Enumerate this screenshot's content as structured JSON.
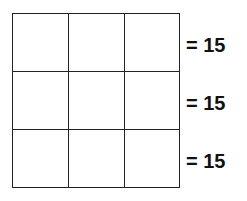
{
  "grid": {
    "rows": 3,
    "cols": 3,
    "cells": [
      [
        "",
        "",
        ""
      ],
      [
        "",
        "",
        ""
      ],
      [
        "",
        "",
        ""
      ]
    ]
  },
  "row_sums": [
    {
      "equals": "=",
      "value": "15",
      "label": "= 15"
    },
    {
      "equals": "=",
      "value": "15",
      "label": "= 15"
    },
    {
      "equals": "=",
      "value": "15",
      "label": "= 15"
    }
  ]
}
